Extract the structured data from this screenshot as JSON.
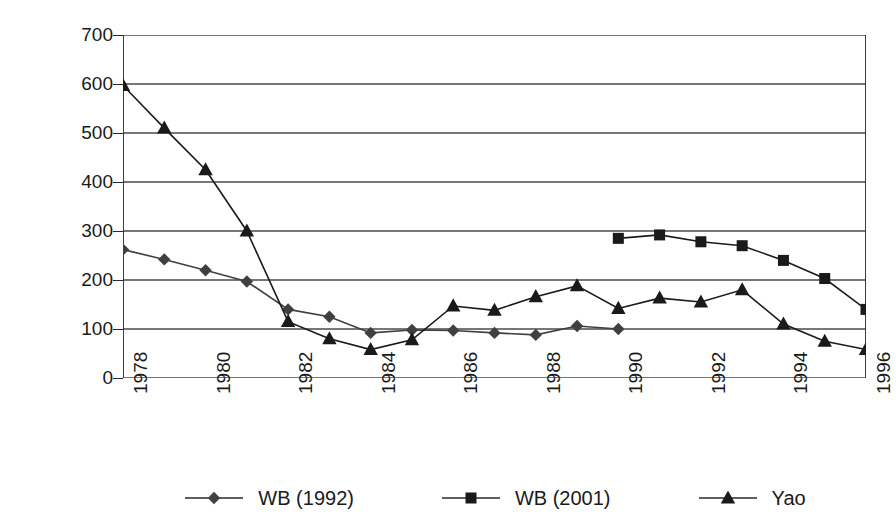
{
  "chart_data": {
    "type": "line",
    "title": "",
    "xlabel": "",
    "ylabel": "(millions of persons)",
    "xlim": [
      1978,
      1996
    ],
    "ylim": [
      0,
      700
    ],
    "ytick_values": [
      700,
      600,
      500,
      400,
      300,
      200,
      100,
      0
    ],
    "ytick_labels": [
      "700",
      "600",
      "500",
      "400",
      "300",
      "200",
      "100",
      "0"
    ],
    "x": [
      1978,
      1979,
      1980,
      1981,
      1982,
      1983,
      1984,
      1985,
      1986,
      1987,
      1988,
      1989,
      1990,
      1991,
      1992,
      1993,
      1994,
      1995,
      1996
    ],
    "xtick_labels": [
      "1978",
      "",
      "1980",
      "",
      "1982",
      "",
      "1984",
      "",
      "1986",
      "",
      "1988",
      "",
      "1990",
      "",
      "1992",
      "",
      "1994",
      "",
      "1996"
    ],
    "grid": "horizontal",
    "legend_position": "bottom",
    "series": [
      {
        "name": "WB (1992)",
        "marker": "diamond",
        "color": "#404040",
        "x": [
          1978,
          1979,
          1980,
          1981,
          1982,
          1983,
          1984,
          1985,
          1986,
          1987,
          1988,
          1989,
          1990
        ],
        "values": [
          262,
          242,
          220,
          197,
          140,
          125,
          92,
          98,
          97,
          92,
          88,
          106,
          100
        ]
      },
      {
        "name": "WB (2001)",
        "marker": "square",
        "color": "#1a1a1a",
        "x": [
          1990,
          1991,
          1992,
          1993,
          1994,
          1995,
          1996
        ],
        "values": [
          285,
          292,
          278,
          270,
          240,
          203,
          140
        ]
      },
      {
        "name": "Yao",
        "marker": "triangle",
        "color": "#1a1a1a",
        "x": [
          1978,
          1979,
          1980,
          1981,
          1982,
          1983,
          1984,
          1985,
          1986,
          1987,
          1988,
          1989,
          1990,
          1991,
          1992,
          1993,
          1994,
          1995,
          1996
        ],
        "values": [
          597,
          510,
          425,
          300,
          115,
          80,
          58,
          78,
          147,
          138,
          166,
          188,
          142,
          163,
          155,
          180,
          110,
          75,
          58
        ]
      }
    ]
  },
  "legend": {
    "items": [
      {
        "label": "WB (1992)",
        "marker": "diamond"
      },
      {
        "label": "WB (2001)",
        "marker": "square"
      },
      {
        "label": "Yao",
        "marker": "triangle"
      }
    ]
  }
}
